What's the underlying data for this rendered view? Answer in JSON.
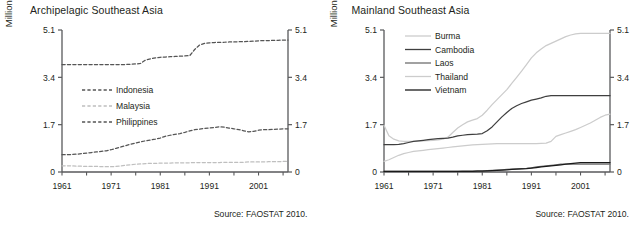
{
  "figure": {
    "width": 643,
    "height": 227,
    "background": "#ffffff",
    "source_note": "Source: FAOSTAT 2010."
  },
  "panels": [
    {
      "id": "archipelagic",
      "title": "Archipelagic Southeast Asia",
      "ylabel": "Million hectares",
      "source": "Source: FAOSTAT 2010."
    },
    {
      "id": "mainland",
      "title": "Mainland Southeast Asia",
      "ylabel": "Million hectares",
      "source": "Source: FAOSTAT 2010."
    }
  ],
  "chart_data": [
    {
      "type": "line",
      "title": "Archipelagic Southeast Asia",
      "xlabel": "",
      "ylabel": "Million hectares",
      "xlim": [
        1961,
        2007
      ],
      "ylim": [
        0,
        5.1
      ],
      "yticks": [
        0,
        1.7,
        3.4,
        5.1
      ],
      "ytick_labels": [
        "0",
        "1.7",
        "3.4",
        "5.1"
      ],
      "xticks": [
        1961,
        1971,
        1981,
        1991,
        2001
      ],
      "xtick_labels": [
        "1961",
        "1971",
        "1981",
        "1991",
        "2001"
      ],
      "minor_xtick_interval": 5,
      "grid": false,
      "legend_position": "center-left",
      "dual_y_axis": true,
      "x": [
        1961,
        1962,
        1963,
        1964,
        1965,
        1966,
        1967,
        1968,
        1969,
        1970,
        1971,
        1972,
        1973,
        1974,
        1975,
        1976,
        1977,
        1978,
        1979,
        1980,
        1981,
        1982,
        1983,
        1984,
        1985,
        1986,
        1987,
        1988,
        1989,
        1990,
        1991,
        1992,
        1993,
        1994,
        1995,
        1996,
        1997,
        1998,
        1999,
        2000,
        2001,
        2002,
        2003,
        2004,
        2005,
        2006,
        2007
      ],
      "series": [
        {
          "name": "Indonesia",
          "color": "#555555",
          "style": "dashed",
          "values": [
            3.86,
            3.86,
            3.86,
            3.86,
            3.86,
            3.86,
            3.86,
            3.86,
            3.86,
            3.86,
            3.86,
            3.86,
            3.86,
            3.86,
            3.87,
            3.88,
            3.9,
            4.02,
            4.06,
            4.1,
            4.12,
            4.13,
            4.14,
            4.15,
            4.16,
            4.17,
            4.18,
            4.4,
            4.56,
            4.62,
            4.64,
            4.65,
            4.66,
            4.66,
            4.67,
            4.67,
            4.68,
            4.68,
            4.69,
            4.7,
            4.71,
            4.72,
            4.72,
            4.73,
            4.73,
            4.74,
            4.74
          ]
        },
        {
          "name": "Malaysia",
          "color": "#bfbfbf",
          "style": "dashed",
          "values": [
            0.22,
            0.22,
            0.22,
            0.21,
            0.21,
            0.2,
            0.2,
            0.2,
            0.19,
            0.19,
            0.19,
            0.2,
            0.22,
            0.24,
            0.26,
            0.28,
            0.29,
            0.3,
            0.31,
            0.31,
            0.32,
            0.32,
            0.32,
            0.33,
            0.33,
            0.33,
            0.33,
            0.34,
            0.34,
            0.34,
            0.34,
            0.34,
            0.34,
            0.35,
            0.35,
            0.35,
            0.35,
            0.35,
            0.36,
            0.36,
            0.36,
            0.36,
            0.37,
            0.37,
            0.37,
            0.38,
            0.38
          ]
        },
        {
          "name": "Philippines",
          "color": "#555555",
          "style": "dashed",
          "values": [
            0.62,
            0.62,
            0.63,
            0.64,
            0.66,
            0.68,
            0.7,
            0.72,
            0.74,
            0.76,
            0.8,
            0.85,
            0.9,
            0.95,
            1.0,
            1.04,
            1.08,
            1.12,
            1.15,
            1.18,
            1.22,
            1.28,
            1.32,
            1.35,
            1.38,
            1.42,
            1.48,
            1.52,
            1.54,
            1.57,
            1.58,
            1.6,
            1.62,
            1.61,
            1.58,
            1.55,
            1.52,
            1.48,
            1.44,
            1.46,
            1.5,
            1.52,
            1.52,
            1.53,
            1.54,
            1.55,
            1.55
          ]
        }
      ]
    },
    {
      "type": "line",
      "title": "Mainland Southeast Asia",
      "xlabel": "",
      "ylabel": "Million hectares",
      "xlim": [
        1961,
        2007
      ],
      "ylim": [
        0,
        5.1
      ],
      "yticks": [
        0,
        1.7,
        3.4,
        5.1
      ],
      "ytick_labels": [
        "0",
        "1.7",
        "3.4",
        "5.1"
      ],
      "xticks": [
        1961,
        1971,
        1981,
        1991,
        2001
      ],
      "xtick_labels": [
        "1961",
        "1971",
        "1981",
        "1991",
        "2001"
      ],
      "minor_xtick_interval": 5,
      "grid": false,
      "legend_position": "top-left",
      "dual_y_axis": true,
      "x": [
        1961,
        1962,
        1963,
        1964,
        1965,
        1966,
        1967,
        1968,
        1969,
        1970,
        1971,
        1972,
        1973,
        1974,
        1975,
        1976,
        1977,
        1978,
        1979,
        1980,
        1981,
        1982,
        1983,
        1984,
        1985,
        1986,
        1987,
        1988,
        1989,
        1990,
        1991,
        1992,
        1993,
        1994,
        1995,
        1996,
        1997,
        1998,
        1999,
        2000,
        2001,
        2002,
        2003,
        2004,
        2005,
        2006,
        2007
      ],
      "series": [
        {
          "name": "Burma",
          "color": "#cccccc",
          "style": "solid",
          "values": [
            1.68,
            1.3,
            1.18,
            1.12,
            1.1,
            1.1,
            1.1,
            1.11,
            1.12,
            1.13,
            1.14,
            1.15,
            1.18,
            1.25,
            1.42,
            1.58,
            1.7,
            1.8,
            1.86,
            1.92,
            2.04,
            2.22,
            2.42,
            2.6,
            2.78,
            2.96,
            3.18,
            3.4,
            3.62,
            3.86,
            4.1,
            4.28,
            4.42,
            4.54,
            4.62,
            4.7,
            4.78,
            4.86,
            4.92,
            4.96,
            4.98,
            4.98,
            4.98,
            4.98,
            4.98,
            4.98,
            4.98
          ]
        },
        {
          "name": "Cambodia",
          "color": "#3f3f3f",
          "style": "solid",
          "values": [
            0.98,
            0.98,
            0.98,
            0.99,
            1.02,
            1.06,
            1.1,
            1.12,
            1.14,
            1.16,
            1.18,
            1.2,
            1.21,
            1.22,
            1.25,
            1.3,
            1.32,
            1.34,
            1.35,
            1.36,
            1.38,
            1.48,
            1.62,
            1.8,
            1.98,
            2.14,
            2.28,
            2.38,
            2.46,
            2.52,
            2.58,
            2.62,
            2.66,
            2.72,
            2.74,
            2.74,
            2.74,
            2.74,
            2.74,
            2.74,
            2.74,
            2.74,
            2.74,
            2.74,
            2.74,
            2.74,
            2.74
          ]
        },
        {
          "name": "Laos",
          "color": "#6e6e6e",
          "style": "solid",
          "values": [
            0.02,
            0.02,
            0.02,
            0.02,
            0.02,
            0.02,
            0.02,
            0.02,
            0.02,
            0.02,
            0.02,
            0.02,
            0.02,
            0.02,
            0.02,
            0.02,
            0.03,
            0.03,
            0.03,
            0.04,
            0.04,
            0.05,
            0.06,
            0.07,
            0.08,
            0.09,
            0.1,
            0.11,
            0.12,
            0.13,
            0.15,
            0.18,
            0.2,
            0.22,
            0.24,
            0.26,
            0.28,
            0.28,
            0.28,
            0.28,
            0.28,
            0.28,
            0.28,
            0.28,
            0.28,
            0.28,
            0.28
          ]
        },
        {
          "name": "Thailand",
          "color": "#cccccc",
          "style": "solid",
          "values": [
            0.38,
            0.44,
            0.52,
            0.6,
            0.66,
            0.7,
            0.74,
            0.76,
            0.78,
            0.8,
            0.82,
            0.84,
            0.86,
            0.88,
            0.9,
            0.92,
            0.94,
            0.96,
            0.97,
            0.98,
            0.99,
            1.0,
            1.01,
            1.02,
            1.02,
            1.02,
            1.02,
            1.02,
            1.02,
            1.02,
            1.02,
            1.02,
            1.03,
            1.04,
            1.1,
            1.28,
            1.34,
            1.4,
            1.46,
            1.52,
            1.6,
            1.68,
            1.76,
            1.86,
            1.96,
            2.04,
            2.08
          ]
        },
        {
          "name": "Vietnam",
          "color": "#1a1a1a",
          "style": "solid",
          "values": [
            0.02,
            0.02,
            0.02,
            0.02,
            0.02,
            0.02,
            0.02,
            0.02,
            0.02,
            0.02,
            0.02,
            0.02,
            0.02,
            0.02,
            0.02,
            0.02,
            0.02,
            0.02,
            0.02,
            0.03,
            0.03,
            0.04,
            0.05,
            0.06,
            0.07,
            0.08,
            0.09,
            0.1,
            0.11,
            0.12,
            0.14,
            0.16,
            0.18,
            0.2,
            0.22,
            0.24,
            0.26,
            0.28,
            0.3,
            0.32,
            0.34,
            0.34,
            0.34,
            0.34,
            0.34,
            0.34,
            0.34
          ]
        }
      ]
    }
  ]
}
